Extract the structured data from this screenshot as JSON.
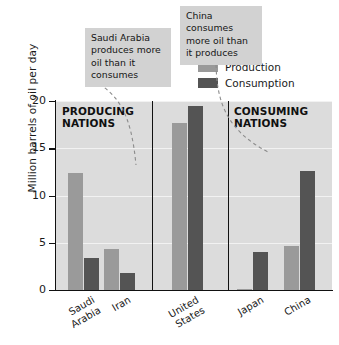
{
  "chart_data": {
    "type": "bar",
    "title": "",
    "xlabel": "",
    "ylabel": "Million barrels of oil per day",
    "ylim": [
      0,
      20
    ],
    "yticks": [
      0,
      5,
      10,
      15,
      20
    ],
    "ytick_labels": [
      "0",
      "5",
      "10",
      "15",
      "20"
    ],
    "grid": true,
    "grid_axis": "y",
    "legend_position": "top-right",
    "categories": [
      "Saudi Arabia",
      "Iran",
      "United States",
      "Japan",
      "China"
    ],
    "series": [
      {
        "name": "Production",
        "color": "#9a9a9a",
        "values": [
          12.4,
          4.3,
          17.7,
          0.1,
          4.7
        ]
      },
      {
        "name": "Consumption",
        "color": "#545454",
        "values": [
          3.4,
          1.8,
          19.5,
          4.0,
          12.6
        ]
      }
    ],
    "annotations": [
      {
        "name": "producing-nations",
        "text_line1": "PRODUCING",
        "text_line2": "NATIONS"
      },
      {
        "name": "consuming-nations",
        "text_line1": "CONSUMING",
        "text_line2": "NATIONS"
      },
      {
        "name": "saudi-callout",
        "text": "Saudi Arabia produces more oil than it consumes"
      },
      {
        "name": "china-callout",
        "text": "China consumes more oil than it produces"
      }
    ],
    "colors": {
      "plot_background": "#dcdcdc",
      "gridline": "#f2f2f2",
      "axis": "#111111",
      "callout_background": "#d2d2d2",
      "leader_line": "#8c8c8c"
    }
  },
  "axis": {
    "y_title": "Million barrels of oil per day",
    "ticks": [
      {
        "value": 20,
        "label": "20"
      },
      {
        "value": 15,
        "label": "15"
      },
      {
        "value": 10,
        "label": "10"
      },
      {
        "value": 5,
        "label": "5"
      },
      {
        "value": 0,
        "label": "0"
      }
    ]
  },
  "x_labels": [
    {
      "line1": "Saudi",
      "line2": "Arabia"
    },
    {
      "line1": "Iran",
      "line2": ""
    },
    {
      "line1": "United",
      "line2": "States"
    },
    {
      "line1": "Japan",
      "line2": ""
    },
    {
      "line1": "China",
      "line2": ""
    }
  ],
  "legend": {
    "items": [
      {
        "label": "Production",
        "color": "#9a9a9a"
      },
      {
        "label": "Consumption",
        "color": "#545454"
      }
    ]
  },
  "sections": {
    "producing": {
      "line1": "PRODUCING",
      "line2": "NATIONS"
    },
    "consuming": {
      "line1": "CONSUMING",
      "line2": "NATIONS"
    }
  },
  "callouts": {
    "saudi": {
      "text": "Saudi Arabia produces more oil than it consumes"
    },
    "china": {
      "text": "China consumes more oil than it produces"
    }
  }
}
